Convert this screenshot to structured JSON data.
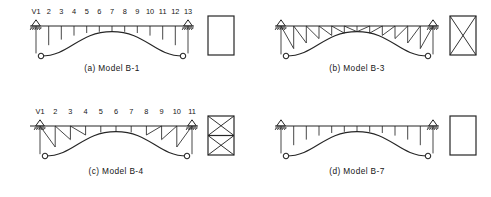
{
  "figure": {
    "background": "#ffffff",
    "ink": "#262626",
    "panels": [
      {
        "id": "a",
        "caption": "(a)  Model   B-1",
        "model": "B-1",
        "web_type": "vertical-hangers",
        "node_labels": [
          "V1",
          "2",
          "3",
          "4",
          "5",
          "6",
          "7",
          "8",
          "9",
          "10",
          "11",
          "12",
          "13"
        ],
        "node_count": 13,
        "section_type": "plain-rectangle",
        "section_label": "rectangular box section"
      },
      {
        "id": "b",
        "caption": "(b)  Model   B-3",
        "model": "B-3",
        "web_type": "diagonal-truss",
        "node_labels": [],
        "node_count": 13,
        "section_type": "single-x-brace",
        "section_label": "rectangular box with single X bracing"
      },
      {
        "id": "c",
        "caption": "(c)  Model   B-4",
        "model": "B-4",
        "web_type": "mixed-diagonal-vertical",
        "node_labels": [
          "V1",
          "2",
          "3",
          "4",
          "5",
          "6",
          "7",
          "8",
          "9",
          "10",
          "11"
        ],
        "node_count": 11,
        "section_type": "double-x-brace",
        "section_label": "rectangular box with two stacked X braces"
      },
      {
        "id": "d",
        "caption": "(d)  Model   B-7",
        "model": "B-7",
        "web_type": "vertical-hangers",
        "node_labels": [],
        "node_count": 13,
        "section_type": "plain-rectangle",
        "section_label": "rectangular box section"
      }
    ],
    "elements": {
      "support": "roller-support-triangle",
      "pin": "pin-circle",
      "rib": "arch-rib",
      "deck": "deck-chord"
    }
  }
}
